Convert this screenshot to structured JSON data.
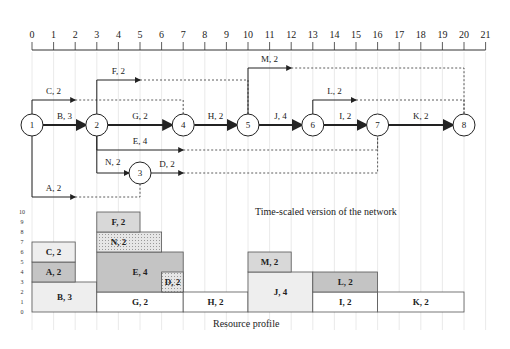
{
  "timeline": {
    "ticks": [
      0,
      1,
      2,
      3,
      4,
      5,
      6,
      7,
      8,
      9,
      10,
      11,
      12,
      13,
      14,
      15,
      16,
      17,
      18,
      19,
      20,
      21
    ]
  },
  "network": {
    "caption": "Time-scaled version of the network",
    "nodes": [
      {
        "id": "1",
        "time": 0,
        "row": "main"
      },
      {
        "id": "2",
        "time": 3,
        "row": "main"
      },
      {
        "id": "3",
        "time": 5,
        "row": "n3"
      },
      {
        "id": "4",
        "time": 7,
        "row": "main"
      },
      {
        "id": "5",
        "time": 10,
        "row": "main"
      },
      {
        "id": "6",
        "time": 13,
        "row": "main"
      },
      {
        "id": "7",
        "time": 16,
        "row": "main"
      },
      {
        "id": "8",
        "time": 20,
        "row": "main"
      }
    ],
    "activities": [
      {
        "label": "B, 3",
        "from": "1",
        "to": "2",
        "start": 0,
        "duration": 3,
        "critical": true,
        "row": "main"
      },
      {
        "label": "C, 2",
        "from": "1",
        "to": "4",
        "start": 0,
        "duration": 2,
        "critical": false,
        "row": "c",
        "dummy_end": 7
      },
      {
        "label": "A, 2",
        "from": "1",
        "to": "3",
        "start": 0,
        "duration": 2,
        "critical": false,
        "row": "a",
        "dummy_end": 5
      },
      {
        "label": "F, 2",
        "from": "2",
        "to": "5",
        "start": 3,
        "duration": 2,
        "critical": false,
        "row": "f",
        "dummy_end": 10
      },
      {
        "label": "G, 2",
        "from": "2",
        "to": "4",
        "start": 3,
        "duration": 4,
        "critical": true,
        "row": "main"
      },
      {
        "label": "E, 4",
        "from": "2",
        "to": "7",
        "start": 3,
        "duration": 4,
        "critical": false,
        "row": "e",
        "dummy_end": 16
      },
      {
        "label": "N, 2",
        "from": "2",
        "to": "3",
        "start": 3,
        "duration": 2,
        "critical": false,
        "row": "n3"
      },
      {
        "label": "D, 2",
        "from": "3",
        "to": "7",
        "start": 5,
        "duration": 2,
        "critical": false,
        "row": "n3",
        "dummy_end": 16
      },
      {
        "label": "H, 2",
        "from": "4",
        "to": "5",
        "start": 7,
        "duration": 3,
        "critical": true,
        "row": "main"
      },
      {
        "label": "M, 2",
        "from": "5",
        "to": "8",
        "start": 10,
        "duration": 2,
        "critical": false,
        "row": "m",
        "dummy_end": 20
      },
      {
        "label": "J, 4",
        "from": "5",
        "to": "6",
        "start": 10,
        "duration": 3,
        "critical": true,
        "row": "main"
      },
      {
        "label": "L, 2",
        "from": "6",
        "to": "8",
        "start": 13,
        "duration": 2,
        "critical": false,
        "row": "l",
        "dummy_end": 20
      },
      {
        "label": "I, 2",
        "from": "6",
        "to": "7",
        "start": 13,
        "duration": 3,
        "critical": true,
        "row": "main"
      },
      {
        "label": "K, 2",
        "from": "7",
        "to": "8",
        "start": 16,
        "duration": 4,
        "critical": true,
        "row": "main"
      }
    ]
  },
  "resource_profile": {
    "caption": "Resource profile",
    "y_ticks": [
      0,
      1,
      2,
      3,
      4,
      5,
      6,
      7,
      8,
      9,
      10
    ],
    "blocks": [
      {
        "label": "B, 3",
        "start": 0,
        "end": 3,
        "base": 0,
        "top": 3,
        "shade": "light"
      },
      {
        "label": "A, 2",
        "start": 0,
        "end": 2,
        "base": 3,
        "top": 5,
        "shade": "dark"
      },
      {
        "label": "C, 2",
        "start": 0,
        "end": 2,
        "base": 5,
        "top": 7,
        "shade": "light"
      },
      {
        "label": "G, 2",
        "start": 3,
        "end": 7,
        "base": 0,
        "top": 2,
        "shade": "white"
      },
      {
        "label": "E, 4",
        "start": 3,
        "end": 7,
        "base": 2,
        "top": 6,
        "shade": "dark"
      },
      {
        "label": "N, 2",
        "start": 3,
        "end": 6,
        "base": 6,
        "top": 8,
        "shade": "dotted",
        "label_span_end": 5
      },
      {
        "label": "F, 2",
        "start": 3,
        "end": 5,
        "base": 8,
        "top": 10,
        "shade": "medium"
      },
      {
        "label": "D, 2",
        "start": 6,
        "end": 7,
        "base": 2,
        "top": 4,
        "shade": "dotted"
      },
      {
        "label": "H, 2",
        "start": 7,
        "end": 10,
        "base": 0,
        "top": 2,
        "shade": "white"
      },
      {
        "label": "J, 4",
        "start": 10,
        "end": 13,
        "base": 0,
        "top": 4,
        "shade": "light"
      },
      {
        "label": "M, 2",
        "start": 10,
        "end": 12,
        "base": 4,
        "top": 6,
        "shade": "medium"
      },
      {
        "label": "I, 2",
        "start": 13,
        "end": 16,
        "base": 0,
        "top": 2,
        "shade": "white"
      },
      {
        "label": "L, 2",
        "start": 13,
        "end": 16,
        "base": 2,
        "top": 4,
        "shade": "dark"
      },
      {
        "label": "K, 2",
        "start": 16,
        "end": 20,
        "base": 0,
        "top": 2,
        "shade": "white"
      }
    ],
    "colors": {
      "white": "#ffffff",
      "light": "#eeeeee",
      "medium": "#d8d8d8",
      "dark": "#c4c4c4",
      "dotted": "#e2e2e2"
    }
  }
}
